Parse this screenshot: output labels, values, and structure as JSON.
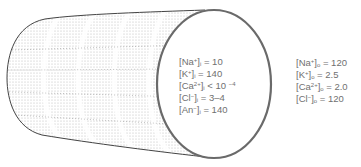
{
  "diagram": {
    "colors": {
      "outline": "#555555",
      "text": "#707070",
      "stipple": "#bdbdbd"
    },
    "intracellular": [
      {
        "ion": "Na",
        "charge": "+",
        "side": "i",
        "op": "=",
        "value": "10"
      },
      {
        "ion": "K",
        "charge": "+",
        "side": "i",
        "op": "=",
        "value": "140"
      },
      {
        "ion": "Ca",
        "charge": "2+",
        "side": "i",
        "op": "<",
        "value": "10",
        "exp": "−4"
      },
      {
        "ion": "Cl",
        "charge": "−",
        "side": "i",
        "op": "=",
        "value": "3–4"
      },
      {
        "ion": "An",
        "charge": "−",
        "side": "i",
        "op": "=",
        "value": "140"
      }
    ],
    "extracellular": [
      {
        "ion": "Na",
        "charge": "+",
        "side": "o",
        "op": "=",
        "value": "120"
      },
      {
        "ion": "K",
        "charge": "+",
        "side": "o",
        "op": "=",
        "value": "2.5"
      },
      {
        "ion": "Ca",
        "charge": "2+",
        "side": "o",
        "op": "=",
        "value": "2.0"
      },
      {
        "ion": "Cl",
        "charge": "−",
        "side": "o",
        "op": "=",
        "value": "120"
      }
    ]
  }
}
